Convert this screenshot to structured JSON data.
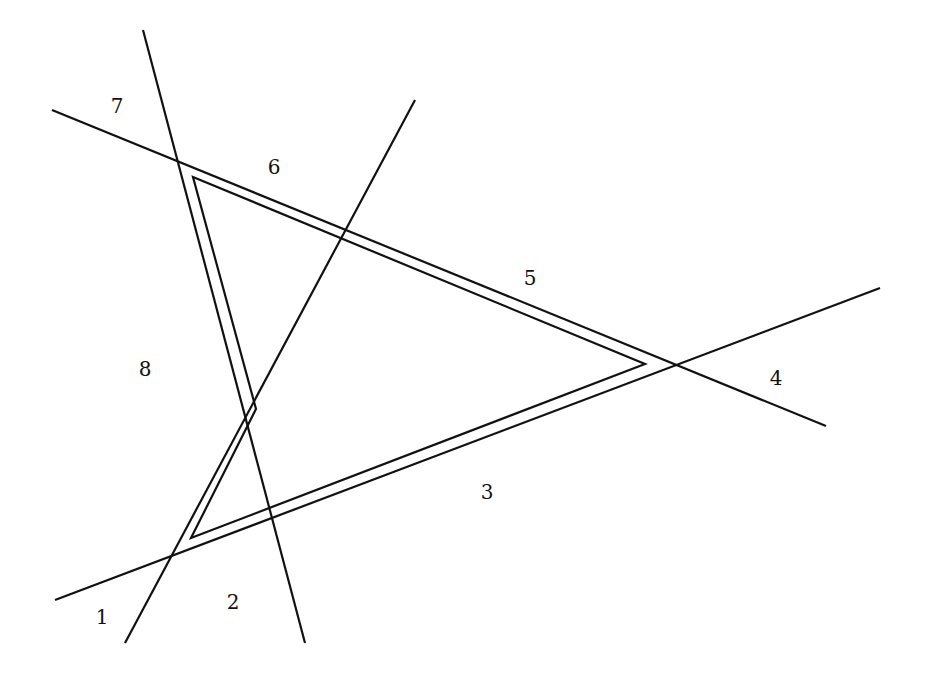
{
  "diagram": {
    "colors": {
      "stroke": "#111111",
      "background": "#ffffff"
    },
    "lines": [
      {
        "id": "line-a",
        "x1": 52,
        "y1": 110,
        "x2": 826,
        "y2": 426
      },
      {
        "id": "line-b",
        "x1": 143,
        "y1": 30,
        "x2": 305,
        "y2": 643
      },
      {
        "id": "line-c",
        "x1": 415,
        "y1": 100,
        "x2": 125,
        "y2": 643
      },
      {
        "id": "line-d",
        "x1": 55,
        "y1": 600,
        "x2": 880,
        "y2": 288
      }
    ],
    "inner_path": {
      "points": "193,177 645,364 191,538 256,409"
    },
    "region_labels": [
      {
        "id": "1",
        "text": "1",
        "x": 102,
        "y": 617
      },
      {
        "id": "2",
        "text": "2",
        "x": 233,
        "y": 602
      },
      {
        "id": "3",
        "text": "3",
        "x": 487,
        "y": 492
      },
      {
        "id": "4",
        "text": "4",
        "x": 776,
        "y": 378
      },
      {
        "id": "5",
        "text": "5",
        "x": 530,
        "y": 278
      },
      {
        "id": "6",
        "text": "6",
        "x": 274,
        "y": 167
      },
      {
        "id": "7",
        "text": "7",
        "x": 117,
        "y": 106
      },
      {
        "id": "8",
        "text": "8",
        "x": 145,
        "y": 369
      }
    ]
  }
}
